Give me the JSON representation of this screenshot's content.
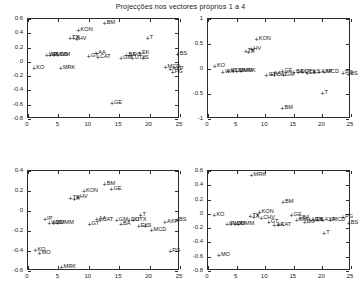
{
  "figure": {
    "title": "Projecções nos vectores próprios 1 a 4",
    "background": "#ffffff",
    "axis_color": "#2b2b2b",
    "text_color": "#161616"
  },
  "chart_data": {
    "type": "scatter",
    "title": "Projecções nos vectores próprios 1 a 4",
    "xlabel": "",
    "ylabel": "",
    "grid": false,
    "legend": "none",
    "marker": "+",
    "panels": [
      {
        "name": "eigenvector-1",
        "position": "top-left",
        "xlim": [
          0,
          25
        ],
        "ylim": [
          -0.8,
          0.6
        ],
        "xticks": [
          0,
          5,
          10,
          15,
          20,
          25
        ],
        "yticks": [
          0.6,
          0.4,
          0.2,
          0,
          -0.2,
          -0.4,
          -0.6,
          -0.8
        ],
        "points": [
          {
            "label": "KO",
            "x": 1.0,
            "y": -0.09
          },
          {
            "label": "WX",
            "x": 3.1,
            "y": 0.1
          },
          {
            "label": "IP",
            "x": 3.6,
            "y": 0.1
          },
          {
            "label": "MMM",
            "x": 4.3,
            "y": 0.09
          },
          {
            "label": "DD",
            "x": 4.9,
            "y": 0.09
          },
          {
            "label": "MRK",
            "x": 5.4,
            "y": -0.09
          },
          {
            "label": "TX",
            "x": 6.9,
            "y": 0.33
          },
          {
            "label": "X",
            "x": 7.5,
            "y": 0.33
          },
          {
            "label": "HV",
            "x": 8.0,
            "y": 0.32
          },
          {
            "label": "KON",
            "x": 8.3,
            "y": 0.44
          },
          {
            "label": "GT",
            "x": 10.0,
            "y": 0.08
          },
          {
            "label": "AA",
            "x": 11.2,
            "y": 0.13
          },
          {
            "label": "CAT",
            "x": 11.5,
            "y": 0.07
          },
          {
            "label": "BM",
            "x": 12.6,
            "y": 0.54
          },
          {
            "label": "GE",
            "x": 13.8,
            "y": -0.57
          },
          {
            "label": "GM",
            "x": 15.3,
            "y": 0.05
          },
          {
            "label": "BA",
            "x": 16.2,
            "y": 0.09
          },
          {
            "label": "DO",
            "x": 16.9,
            "y": 0.09
          },
          {
            "label": "UTX",
            "x": 17.2,
            "y": 0.05
          },
          {
            "label": "EK",
            "x": 18.4,
            "y": 0.12
          },
          {
            "label": "S",
            "x": 18.9,
            "y": 0.05
          },
          {
            "label": "T",
            "x": 19.7,
            "y": 0.33
          },
          {
            "label": "MCD",
            "x": 22.6,
            "y": -0.07
          },
          {
            "label": "AXP",
            "x": 23.4,
            "y": -0.1
          },
          {
            "label": "PG",
            "x": 23.8,
            "y": -0.14
          },
          {
            "label": "BS",
            "x": 24.6,
            "y": 0.11
          }
        ]
      },
      {
        "name": "eigenvector-2",
        "position": "top-right",
        "xlim": [
          0,
          25
        ],
        "ylim": [
          -1,
          1
        ],
        "xticks": [
          0,
          5,
          10,
          15,
          20,
          25
        ],
        "yticks": [
          1,
          0.5,
          0,
          -0.5,
          -1
        ],
        "points": [
          {
            "label": "KO",
            "x": 1.2,
            "y": 0.06
          },
          {
            "label": "WX",
            "x": 2.6,
            "y": -0.06
          },
          {
            "label": "IP",
            "x": 3.6,
            "y": -0.04
          },
          {
            "label": "DD",
            "x": 4.4,
            "y": -0.04
          },
          {
            "label": "MMM",
            "x": 5.0,
            "y": -0.04
          },
          {
            "label": "MRK",
            "x": 5.8,
            "y": -0.04
          },
          {
            "label": "TX",
            "x": 6.6,
            "y": 0.36
          },
          {
            "label": "X",
            "x": 7.1,
            "y": 0.34
          },
          {
            "label": "HV",
            "x": 7.6,
            "y": 0.4
          },
          {
            "label": "KON",
            "x": 8.5,
            "y": 0.6
          },
          {
            "label": "GT",
            "x": 10.2,
            "y": -0.12
          },
          {
            "label": "AA",
            "x": 11.1,
            "y": -0.09
          },
          {
            "label": "CAT",
            "x": 11.6,
            "y": -0.11
          },
          {
            "label": "GE",
            "x": 13.0,
            "y": -0.03
          },
          {
            "label": "GM",
            "x": 13.2,
            "y": -0.12
          },
          {
            "label": "BM",
            "x": 13.0,
            "y": -0.77
          },
          {
            "label": "BA",
            "x": 15.0,
            "y": -0.06
          },
          {
            "label": "DO",
            "x": 15.8,
            "y": -0.06
          },
          {
            "label": "UTX",
            "x": 16.5,
            "y": -0.06
          },
          {
            "label": "EK",
            "x": 17.3,
            "y": -0.08
          },
          {
            "label": "S",
            "x": 18.6,
            "y": -0.06
          },
          {
            "label": "AXP",
            "x": 19.4,
            "y": -0.06
          },
          {
            "label": "MCD",
            "x": 20.3,
            "y": -0.06
          },
          {
            "label": "T",
            "x": 20.0,
            "y": -0.47
          },
          {
            "label": "PG",
            "x": 23.6,
            "y": -0.07
          },
          {
            "label": "BS",
            "x": 24.5,
            "y": -0.1
          }
        ]
      },
      {
        "name": "eigenvector-3",
        "position": "bottom-left",
        "xlim": [
          0,
          25
        ],
        "ylim": [
          -0.6,
          0.4
        ],
        "xticks": [
          0,
          5,
          10,
          15,
          20,
          25
        ],
        "yticks": [
          0.4,
          0.2,
          0,
          -0.2,
          -0.4,
          -0.6
        ],
        "points": [
          {
            "label": "KO",
            "x": 1.2,
            "y": -0.39
          },
          {
            "label": "MO",
            "x": 1.9,
            "y": -0.42
          },
          {
            "label": "IP",
            "x": 2.8,
            "y": -0.08
          },
          {
            "label": "WX",
            "x": 3.5,
            "y": -0.12
          },
          {
            "label": "DD",
            "x": 4.2,
            "y": -0.12
          },
          {
            "label": "MMM",
            "x": 4.9,
            "y": -0.12
          },
          {
            "label": "MRK",
            "x": 5.5,
            "y": -0.56
          },
          {
            "label": "TX",
            "x": 7.0,
            "y": 0.13
          },
          {
            "label": "X",
            "x": 7.6,
            "y": 0.12
          },
          {
            "label": "HV",
            "x": 8.2,
            "y": 0.14
          },
          {
            "label": "KON",
            "x": 9.2,
            "y": 0.2
          },
          {
            "label": "GT",
            "x": 10.1,
            "y": -0.13
          },
          {
            "label": "AA",
            "x": 11.3,
            "y": -0.08
          },
          {
            "label": "CAT",
            "x": 11.9,
            "y": -0.09
          },
          {
            "label": "BM",
            "x": 12.6,
            "y": 0.27
          },
          {
            "label": "GE",
            "x": 13.7,
            "y": 0.22
          },
          {
            "label": "GM",
            "x": 14.6,
            "y": -0.09
          },
          {
            "label": "BA",
            "x": 15.3,
            "y": -0.13
          },
          {
            "label": "DO",
            "x": 16.6,
            "y": -0.09
          },
          {
            "label": "UTX",
            "x": 17.3,
            "y": -0.09
          },
          {
            "label": "T",
            "x": 18.5,
            "y": -0.04
          },
          {
            "label": "EK",
            "x": 18.2,
            "y": -0.15
          },
          {
            "label": "S",
            "x": 19.3,
            "y": -0.15
          },
          {
            "label": "MCD",
            "x": 20.3,
            "y": -0.19
          },
          {
            "label": "AXP",
            "x": 22.5,
            "y": -0.11
          },
          {
            "label": "PG",
            "x": 23.4,
            "y": -0.4
          },
          {
            "label": "BS",
            "x": 24.5,
            "y": -0.09
          }
        ]
      },
      {
        "name": "eigenvector-4",
        "position": "bottom-right",
        "xlim": [
          0,
          25
        ],
        "ylim": [
          -0.8,
          0.6
        ],
        "xticks": [
          0,
          5,
          10,
          15,
          20,
          25
        ],
        "yticks": [
          0.6,
          0.4,
          0.2,
          0,
          -0.2,
          -0.4,
          -0.6,
          -0.8
        ],
        "points": [
          {
            "label": "KO",
            "x": 1.1,
            "y": -0.02
          },
          {
            "label": "MO",
            "x": 1.9,
            "y": -0.57
          },
          {
            "label": "IP",
            "x": 3.3,
            "y": -0.14
          },
          {
            "label": "WX",
            "x": 4.0,
            "y": -0.14
          },
          {
            "label": "DD",
            "x": 4.7,
            "y": -0.14
          },
          {
            "label": "MMM",
            "x": 5.3,
            "y": -0.14
          },
          {
            "label": "MRK",
            "x": 7.6,
            "y": 0.55
          },
          {
            "label": "TX",
            "x": 7.4,
            "y": -0.03
          },
          {
            "label": "X",
            "x": 8.0,
            "y": -0.04
          },
          {
            "label": "KON",
            "x": 9.0,
            "y": 0.03
          },
          {
            "label": "CHV",
            "x": 9.3,
            "y": -0.06
          },
          {
            "label": "GT",
            "x": 10.6,
            "y": -0.11
          },
          {
            "label": "AA",
            "x": 11.6,
            "y": -0.16
          },
          {
            "label": "CAT",
            "x": 12.3,
            "y": -0.16
          },
          {
            "label": "BM",
            "x": 13.1,
            "y": 0.17
          },
          {
            "label": "GE",
            "x": 14.6,
            "y": -0.01
          },
          {
            "label": "GM",
            "x": 15.5,
            "y": -0.09
          },
          {
            "label": "BA",
            "x": 16.1,
            "y": -0.06
          },
          {
            "label": "DO",
            "x": 16.9,
            "y": -0.12
          },
          {
            "label": "UTX",
            "x": 17.8,
            "y": -0.08
          },
          {
            "label": "EK",
            "x": 18.4,
            "y": -0.09
          },
          {
            "label": "S",
            "x": 19.2,
            "y": -0.08
          },
          {
            "label": "AXP",
            "x": 20.0,
            "y": -0.08
          },
          {
            "label": "T",
            "x": 20.3,
            "y": -0.27
          },
          {
            "label": "MCD",
            "x": 21.4,
            "y": -0.08
          },
          {
            "label": "PG",
            "x": 23.6,
            "y": -0.05
          },
          {
            "label": "BS",
            "x": 24.6,
            "y": -0.13
          }
        ]
      }
    ]
  }
}
